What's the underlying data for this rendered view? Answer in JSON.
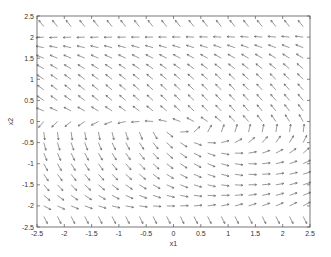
{
  "chart_data": {
    "type": "quiver",
    "title": "",
    "xlabel": "x1",
    "ylabel": "x2",
    "xlim": [
      -2.5,
      2.5
    ],
    "ylim": [
      -2.5,
      2.5
    ],
    "grid": false,
    "legend": null,
    "xticks": [
      "-2.5",
      "-2",
      "-1.5",
      "-1",
      "-0.5",
      "0",
      "0.5",
      "1",
      "1.5",
      "2",
      "2.5"
    ],
    "yticks": [
      "-2.5",
      "-2",
      "-1.5",
      "-1",
      "-0.5",
      "0",
      "0.5",
      "1",
      "1.5",
      "2",
      "2.5"
    ],
    "grid_x": {
      "start": -2.375,
      "step": 0.25,
      "count": 20
    },
    "grid_y": {
      "start": -2.25,
      "step": 0.25,
      "count": 19
    },
    "field_description": "Direction field: arrows point left along x2=2, up-left above x2=2, down/down-left for 0<x2<2, right for x2≈-1 on the left side, up/up-right for x2<0 on the right side, down-right along bottom row; singular region near (-0.5, 0).",
    "arrow_color": "#555555",
    "axis_color": "#555555"
  }
}
